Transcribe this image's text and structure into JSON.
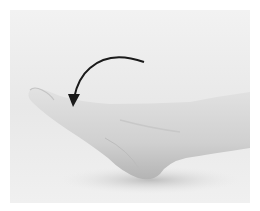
{
  "image": {
    "subject": "foot plantar flexion exercise",
    "description": "Side view of a bare foot pointing toes forward with a curved arrow indicating downward/forward pointing motion",
    "annotations": [
      {
        "type": "curved-arrow",
        "direction": "counterclockwise-down",
        "color": "#1a1a1a"
      }
    ],
    "colors": {
      "background": "#ececec",
      "skin": "#d6d6d6",
      "skin_shadow": "#b8b8b8",
      "arrow": "#1a1a1a"
    }
  }
}
